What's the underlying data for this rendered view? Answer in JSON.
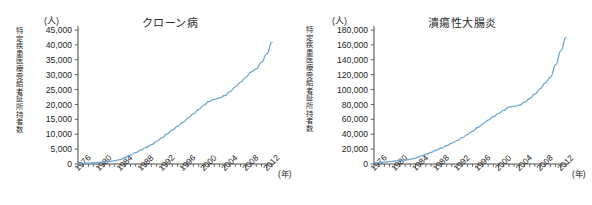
{
  "figure": {
    "background": "#ffffff",
    "line_color": "#6fa8d6",
    "axis_color": "#3a3a3a"
  },
  "charts": [
    {
      "id": "crohn",
      "title": "クローン病",
      "unit_label": "(人)",
      "y_axis_caption": "特定疾患医療受給者証所持者数",
      "x_unit_label": "(年)"
    },
    {
      "id": "ulcerative-colitis",
      "title": "潰瘍性大腸炎",
      "unit_label": "(人)",
      "y_axis_caption": "特定疾患医療受給者証所持者数",
      "x_unit_label": "(年)"
    }
  ],
  "chart_data": [
    {
      "type": "line",
      "title": "クローン病",
      "xlabel": "(年)",
      "ylabel": "特定疾患医療受給者証所持者数",
      "yunit": "(人)",
      "xlim": [
        1976,
        2013
      ],
      "ylim": [
        0,
        45000
      ],
      "ytick_step": 5000,
      "ytick_labels": [
        "0",
        "5,000",
        "10,000",
        "15,000",
        "20,000",
        "25,000",
        "30,000",
        "35,000",
        "40,000",
        "45,000"
      ],
      "xtick_labels": [
        "1976",
        "1980",
        "1984",
        "1988",
        "1992",
        "1996",
        "2000",
        "2004",
        "2008",
        "2012"
      ],
      "xtick_step": 4,
      "minor_xticks": "every year",
      "grid": false,
      "legend": "none",
      "series": [
        {
          "name": "特定疾患医療受給者証所持者数",
          "color": "#6fa8d6",
          "x": [
            1976,
            1977,
            1978,
            1979,
            1980,
            1981,
            1982,
            1983,
            1984,
            1985,
            1986,
            1987,
            1988,
            1989,
            1990,
            1991,
            1992,
            1993,
            1994,
            1995,
            1996,
            1997,
            1998,
            1999,
            2000,
            2001,
            2002,
            2003,
            2004,
            2005,
            2006,
            2007,
            2008,
            2009,
            2010,
            2011,
            2012,
            2013
          ],
          "values": [
            128,
            200,
            300,
            420,
            560,
            700,
            900,
            1100,
            1500,
            2200,
            3000,
            3800,
            4700,
            5600,
            6500,
            7600,
            8800,
            10100,
            11400,
            12700,
            14000,
            15400,
            16800,
            18300,
            19800,
            21000,
            21700,
            22200,
            23000,
            24300,
            25900,
            27500,
            29100,
            30900,
            31900,
            34200,
            37000,
            40900
          ]
        }
      ]
    },
    {
      "type": "line",
      "title": "潰瘍性大腸炎",
      "xlabel": "(年)",
      "ylabel": "特定疾患医療受給者証所持者数",
      "yunit": "(人)",
      "xlim": [
        1976,
        2013
      ],
      "ylim": [
        0,
        180000
      ],
      "ytick_step": 20000,
      "ytick_labels": [
        "0",
        "20,000",
        "40,000",
        "60,000",
        "80,000",
        "100,000",
        "120,000",
        "140,000",
        "160,000",
        "180,000"
      ],
      "xtick_labels": [
        "1976",
        "1980",
        "1984",
        "1988",
        "1992",
        "1996",
        "2000",
        "2004",
        "2008",
        "2012"
      ],
      "xtick_step": 4,
      "minor_xticks": "every year",
      "grid": false,
      "legend": "none",
      "series": [
        {
          "name": "特定疾患医療受給者証所持者数",
          "color": "#6fa8d6",
          "x": [
            1976,
            1977,
            1978,
            1979,
            1980,
            1981,
            1982,
            1983,
            1984,
            1985,
            1986,
            1987,
            1988,
            1989,
            1990,
            1991,
            1992,
            1993,
            1994,
            1995,
            1996,
            1997,
            1998,
            1999,
            2000,
            2001,
            2002,
            2003,
            2004,
            2005,
            2006,
            2007,
            2008,
            2009,
            2010,
            2011,
            2012,
            2013
          ],
          "values": [
            1500,
            2000,
            2600,
            3300,
            4000,
            4800,
            5600,
            6300,
            8000,
            10500,
            13000,
            15500,
            18500,
            21500,
            24500,
            28000,
            31500,
            35500,
            39500,
            44000,
            49000,
            54000,
            59000,
            63500,
            68000,
            72000,
            76500,
            77500,
            79000,
            83000,
            88000,
            94000,
            101000,
            109000,
            116500,
            133000,
            152000,
            170000
          ]
        }
      ]
    }
  ]
}
